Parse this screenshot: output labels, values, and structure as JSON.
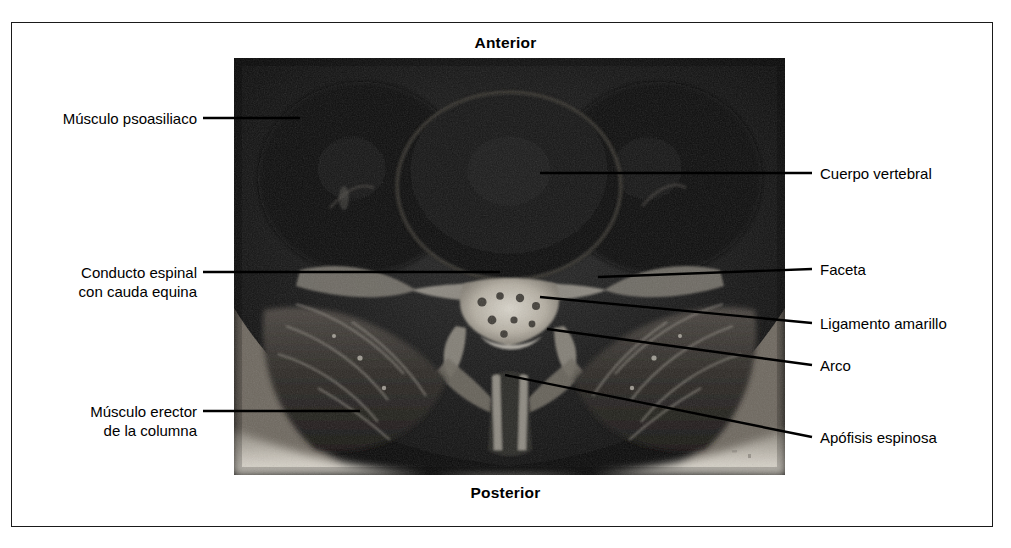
{
  "figure": {
    "frame_color": "#1a1a1a",
    "background": "#ffffff"
  },
  "orientation": {
    "top_label": "Anterior",
    "bottom_label": "Posterior"
  },
  "scan": {
    "modality": "MRI axial lumbar spine",
    "grayscale": true,
    "dark_tone": "#0d0d0d",
    "bright_tone": "#e8e4dc"
  },
  "labels_left": [
    {
      "id": "musculo-psoasiliaco",
      "text": "Músculo psoasiliaco",
      "lines": [
        "Músculo psoasiliaco"
      ],
      "text_right": 197,
      "text_top": 109,
      "leader": {
        "x1": 203,
        "y1": 118,
        "x2": 300,
        "y2": 118
      }
    },
    {
      "id": "conducto-espinal",
      "text": "Conducto espinal con cauda equina",
      "lines": [
        "Conducto espinal",
        "con cauda equina"
      ],
      "text_right": 197,
      "text_top": 263,
      "leader": {
        "x1": 203,
        "y1": 272,
        "x2": 500,
        "y2": 272
      }
    },
    {
      "id": "musculo-erector",
      "text": "Músculo erector de la columna",
      "lines": [
        "Músculo erector",
        "de la columna"
      ],
      "text_right": 197,
      "text_top": 402,
      "leader": {
        "x1": 203,
        "y1": 411,
        "x2": 360,
        "y2": 411
      }
    }
  ],
  "labels_right": [
    {
      "id": "cuerpo-vertebral",
      "text": "Cuerpo vertebral",
      "lines": [
        "Cuerpo vertebral"
      ],
      "text_left": 820,
      "text_top": 164,
      "leader": {
        "x1": 812,
        "y1": 173,
        "x2": 540,
        "y2": 173
      }
    },
    {
      "id": "faceta",
      "text": "Faceta",
      "lines": [
        "Faceta"
      ],
      "text_left": 820,
      "text_top": 260,
      "leader": {
        "x1": 812,
        "y1": 269,
        "x2": 598,
        "y2": 277
      }
    },
    {
      "id": "ligamento-amarillo",
      "text": "Ligamento amarillo",
      "lines": [
        "Ligamento amarillo"
      ],
      "text_left": 820,
      "text_top": 314,
      "leader": {
        "x1": 812,
        "y1": 323,
        "x2": 540,
        "y2": 297
      }
    },
    {
      "id": "arco",
      "text": "Arco",
      "lines": [
        "Arco"
      ],
      "text_left": 820,
      "text_top": 356,
      "leader": {
        "x1": 812,
        "y1": 365,
        "x2": 547,
        "y2": 329
      }
    },
    {
      "id": "apofisis-espinosa",
      "text": "Apófisis espinosa",
      "lines": [
        "Apófisis espinosa"
      ],
      "text_left": 820,
      "text_top": 428,
      "leader": {
        "x1": 812,
        "y1": 437,
        "x2": 505,
        "y2": 375
      }
    }
  ]
}
